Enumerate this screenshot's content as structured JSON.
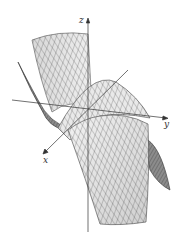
{
  "figure": {
    "type": "3d-surface-mesh",
    "colors": {
      "background": "#ffffff",
      "surface_light": "#e4e4e4",
      "surface_dark": "#9a9a9a",
      "mesh": "#3a3a3a",
      "axis": "#333333"
    },
    "axes": {
      "x": {
        "label": "x"
      },
      "y": {
        "label": "y"
      },
      "z": {
        "label": "z"
      }
    }
  }
}
